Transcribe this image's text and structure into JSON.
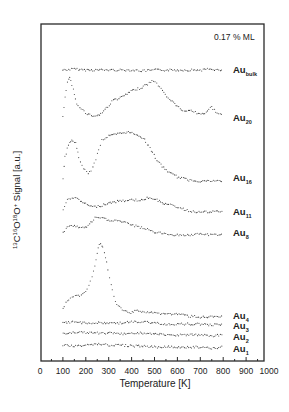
{
  "chart_data": {
    "type": "line",
    "style": "scatter-dots, vertically offset stacked traces",
    "title": "",
    "annotation": "0.17 % ML",
    "xlabel": "Temperature [K]",
    "ylabel": "13C16O18O+ Signal [a.u.]",
    "ylabel_parts": {
      "m1": "13",
      "a1": "C",
      "m2": "16",
      "a2": "O",
      "m3": "18",
      "a3": "O",
      "charge": "+",
      "rest": " Signal [a.u.]"
    },
    "xlim": [
      0,
      1000
    ],
    "x_ticks": [
      0,
      100,
      200,
      300,
      400,
      500,
      600,
      700,
      800,
      900,
      1000
    ],
    "y_ticks": [],
    "grid": false,
    "legend": "labels at right end of each trace",
    "series": [
      {
        "name": "Au_bulk",
        "base": "Au",
        "sub": "bulk",
        "label_y": 70,
        "points": [
          [
            100,
            70
          ],
          [
            150,
            69
          ],
          [
            200,
            70
          ],
          [
            250,
            70
          ],
          [
            300,
            70
          ],
          [
            350,
            70
          ],
          [
            400,
            70
          ],
          [
            450,
            71
          ],
          [
            500,
            70
          ],
          [
            550,
            70
          ],
          [
            600,
            70
          ],
          [
            650,
            70
          ],
          [
            700,
            70
          ],
          [
            750,
            69
          ],
          [
            800,
            71
          ]
        ]
      },
      {
        "name": "Au20",
        "base": "Au",
        "sub": "20",
        "label_y": 118,
        "points": [
          [
            100,
            117
          ],
          [
            110,
            98
          ],
          [
            120,
            82
          ],
          [
            130,
            78
          ],
          [
            140,
            85
          ],
          [
            150,
            95
          ],
          [
            160,
            104
          ],
          [
            180,
            108
          ],
          [
            200,
            113
          ],
          [
            230,
            116
          ],
          [
            260,
            115
          ],
          [
            290,
            108
          ],
          [
            320,
            100
          ],
          [
            350,
            98
          ],
          [
            380,
            94
          ],
          [
            410,
            90
          ],
          [
            440,
            88
          ],
          [
            470,
            84
          ],
          [
            490,
            81
          ],
          [
            510,
            83
          ],
          [
            530,
            89
          ],
          [
            560,
            98
          ],
          [
            600,
            106
          ],
          [
            630,
            112
          ],
          [
            660,
            110
          ],
          [
            690,
            114
          ],
          [
            720,
            113
          ],
          [
            750,
            107
          ],
          [
            780,
            114
          ],
          [
            800,
            116
          ]
        ]
      },
      {
        "name": "Au16",
        "base": "Au",
        "sub": "16",
        "label_y": 178,
        "points": [
          [
            100,
            178
          ],
          [
            110,
            157
          ],
          [
            125,
            145
          ],
          [
            140,
            140
          ],
          [
            155,
            143
          ],
          [
            170,
            158
          ],
          [
            190,
            168
          ],
          [
            210,
            174
          ],
          [
            230,
            168
          ],
          [
            250,
            154
          ],
          [
            270,
            140
          ],
          [
            300,
            136
          ],
          [
            340,
            134
          ],
          [
            380,
            132
          ],
          [
            420,
            134
          ],
          [
            450,
            138
          ],
          [
            480,
            148
          ],
          [
            510,
            160
          ],
          [
            540,
            168
          ],
          [
            570,
            173
          ],
          [
            600,
            177
          ],
          [
            650,
            180
          ],
          [
            700,
            181
          ],
          [
            750,
            181
          ],
          [
            800,
            181
          ]
        ]
      },
      {
        "name": "Au11",
        "base": "Au",
        "sub": "11",
        "label_y": 212,
        "points": [
          [
            100,
            210
          ],
          [
            120,
            200
          ],
          [
            140,
            197
          ],
          [
            170,
            200
          ],
          [
            200,
            204
          ],
          [
            230,
            207
          ],
          [
            260,
            206
          ],
          [
            300,
            203
          ],
          [
            350,
            201
          ],
          [
            400,
            200
          ],
          [
            450,
            200
          ],
          [
            480,
            197
          ],
          [
            510,
            200
          ],
          [
            550,
            204
          ],
          [
            600,
            207
          ],
          [
            650,
            211
          ],
          [
            700,
            212
          ],
          [
            750,
            212
          ],
          [
            800,
            211
          ]
        ]
      },
      {
        "name": "Au8",
        "base": "Au",
        "sub": "8",
        "label_y": 233,
        "points": [
          [
            100,
            233
          ],
          [
            120,
            226
          ],
          [
            150,
            226
          ],
          [
            180,
            228
          ],
          [
            210,
            226
          ],
          [
            240,
            218
          ],
          [
            270,
            218
          ],
          [
            300,
            220
          ],
          [
            350,
            221
          ],
          [
            400,
            225
          ],
          [
            450,
            228
          ],
          [
            500,
            232
          ],
          [
            550,
            234
          ],
          [
            600,
            235
          ],
          [
            650,
            235
          ],
          [
            700,
            234
          ],
          [
            750,
            235
          ],
          [
            800,
            234
          ]
        ]
      },
      {
        "name": "Au4",
        "base": "Au",
        "sub": "4",
        "label_y": 316,
        "points": [
          [
            100,
            309
          ],
          [
            120,
            300
          ],
          [
            140,
            298
          ],
          [
            160,
            296
          ],
          [
            180,
            295
          ],
          [
            200,
            292
          ],
          [
            220,
            282
          ],
          [
            240,
            265
          ],
          [
            255,
            248
          ],
          [
            265,
            243
          ],
          [
            275,
            248
          ],
          [
            290,
            263
          ],
          [
            310,
            285
          ],
          [
            330,
            302
          ],
          [
            360,
            310
          ],
          [
            390,
            313
          ],
          [
            420,
            310
          ],
          [
            450,
            312
          ],
          [
            500,
            313
          ],
          [
            550,
            314
          ],
          [
            600,
            314
          ],
          [
            650,
            316
          ],
          [
            700,
            317
          ],
          [
            750,
            317
          ],
          [
            800,
            317
          ]
        ]
      },
      {
        "name": "Au3",
        "base": "Au",
        "sub": "3",
        "label_y": 326,
        "points": [
          [
            100,
            323
          ],
          [
            150,
            322
          ],
          [
            200,
            323
          ],
          [
            250,
            323
          ],
          [
            300,
            323
          ],
          [
            350,
            323
          ],
          [
            400,
            322
          ],
          [
            450,
            322
          ],
          [
            500,
            323
          ],
          [
            550,
            324
          ],
          [
            600,
            324
          ],
          [
            650,
            324
          ],
          [
            700,
            324
          ],
          [
            750,
            325
          ],
          [
            800,
            324
          ]
        ]
      },
      {
        "name": "Au2",
        "base": "Au",
        "sub": "2",
        "label_y": 337,
        "points": [
          [
            100,
            334
          ],
          [
            150,
            332
          ],
          [
            200,
            333
          ],
          [
            250,
            333
          ],
          [
            300,
            333
          ],
          [
            350,
            334
          ],
          [
            400,
            333
          ],
          [
            450,
            333
          ],
          [
            500,
            334
          ],
          [
            550,
            335
          ],
          [
            600,
            335
          ],
          [
            650,
            335
          ],
          [
            700,
            335
          ],
          [
            750,
            336
          ],
          [
            800,
            335
          ]
        ]
      },
      {
        "name": "Au1",
        "base": "Au",
        "sub": "1",
        "label_y": 349,
        "points": [
          [
            100,
            345
          ],
          [
            150,
            346
          ],
          [
            200,
            345
          ],
          [
            250,
            344
          ],
          [
            300,
            345
          ],
          [
            350,
            345
          ],
          [
            400,
            346
          ],
          [
            450,
            346
          ],
          [
            500,
            347
          ],
          [
            550,
            347
          ],
          [
            600,
            347
          ],
          [
            650,
            347
          ],
          [
            700,
            347
          ],
          [
            750,
            348
          ],
          [
            800,
            347
          ]
        ]
      }
    ],
    "note": "y values are vertical pixel positions of each offset trace (arbitrary units, stacked)"
  },
  "layout": {
    "frame": {
      "left": 41,
      "top": 24,
      "right": 264,
      "bottom": 361
    },
    "x_px_at_0": 40,
    "px_per_K": 0.229
  }
}
